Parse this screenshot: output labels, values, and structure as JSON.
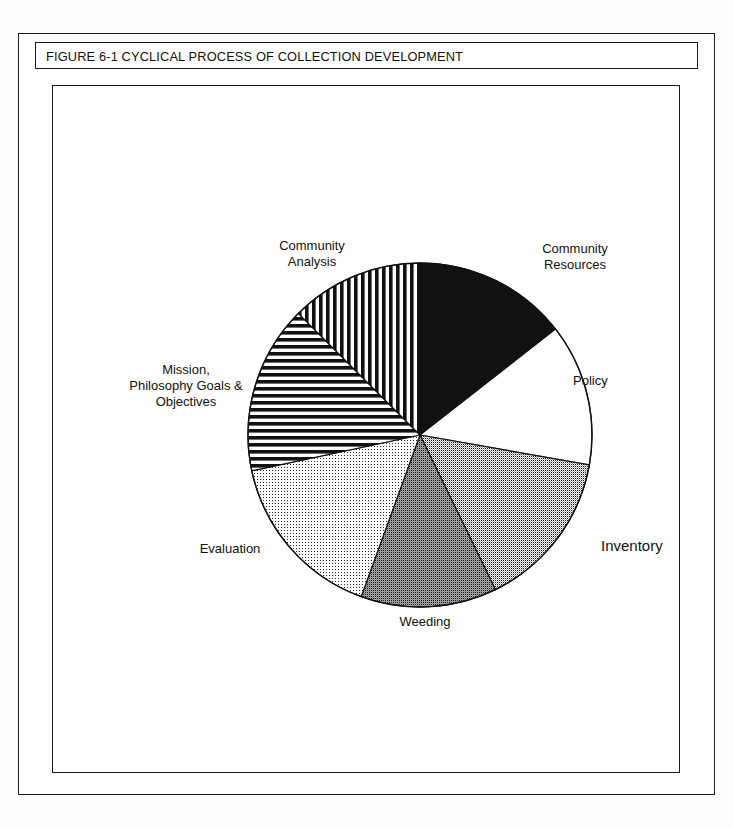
{
  "figure": {
    "caption": "FIGURE 6-1  CYCLICAL PROCESS OF COLLECTION DEVELOPMENT",
    "caption_number": "FIGURE 6-1",
    "caption_title": "CYCLICAL PROCESS OF COLLECTION DEVELOPMENT"
  },
  "chart_data": {
    "type": "pie",
    "title": "CYCLICAL PROCESS OF COLLECTION DEVELOPMENT",
    "xlabel": "",
    "ylabel": "",
    "legend": "none (labels placed around slices)",
    "grid": false,
    "start_angle_deg_from_top": 0,
    "direction": "clockwise",
    "categories": [
      "Community Resources",
      "Policy",
      "Inventory",
      "Weeding",
      "Evaluation",
      "Mission, Philosophy Goals & Objectives",
      "Community Analysis"
    ],
    "values": [
      52,
      48,
      54,
      46,
      58,
      57,
      45
    ],
    "units": "degrees of arc",
    "percentages": [
      14.4,
      13.3,
      15.0,
      12.8,
      16.1,
      15.8,
      12.5
    ],
    "slices": [
      {
        "label": "Community Resources",
        "label_lines": [
          "Community",
          "Resources"
        ],
        "angle_deg": 52,
        "start_deg": 0,
        "end_deg": 52,
        "percent": 14.4,
        "fill": "solid-black",
        "color": "#111111"
      },
      {
        "label": "Policy",
        "label_lines": [
          "Policy"
        ],
        "angle_deg": 48,
        "start_deg": 52,
        "end_deg": 100,
        "percent": 13.3,
        "fill": "solid-white",
        "color": "#ffffff"
      },
      {
        "label": "Inventory",
        "label_lines": [
          "Inventory"
        ],
        "angle_deg": 54,
        "start_deg": 100,
        "end_deg": 154,
        "percent": 15.0,
        "fill": "dotted-medium-dark",
        "color": "#6e6e6e"
      },
      {
        "label": "Weeding",
        "label_lines": [
          "Weeding"
        ],
        "angle_deg": 46,
        "start_deg": 154,
        "end_deg": 200,
        "percent": 12.8,
        "fill": "dotted-dark",
        "color": "#4a4a4a"
      },
      {
        "label": "Evaluation",
        "label_lines": [
          "Evaluation"
        ],
        "angle_deg": 58,
        "start_deg": 200,
        "end_deg": 258,
        "percent": 16.1,
        "fill": "dotted-light",
        "color": "#c9c9c9"
      },
      {
        "label": "Mission, Philosophy Goals & Objectives",
        "label_lines": [
          "Mission,",
          "Philosophy Goals &",
          "Objectives"
        ],
        "angle_deg": 57,
        "start_deg": 258,
        "end_deg": 315,
        "percent": 15.8,
        "fill": "horizontal-hatch",
        "color": "#111111"
      },
      {
        "label": "Community Analysis",
        "label_lines": [
          "Community",
          "Analysis"
        ],
        "angle_deg": 45,
        "start_deg": 315,
        "end_deg": 360,
        "percent": 12.5,
        "fill": "vertical-hatch",
        "color": "#111111"
      }
    ]
  },
  "labels": {
    "community_resources": "Community\nResources",
    "policy": "Policy",
    "inventory": "Inventory",
    "weeding": "Weeding",
    "evaluation": "Evaluation",
    "mission": "Mission,\nPhilosophy Goals &\nObjectives",
    "community_analysis": "Community\nAnalysis"
  },
  "colors": {
    "ink": "#111111",
    "paper": "#ffffff",
    "frame": "#1a1a1a"
  }
}
